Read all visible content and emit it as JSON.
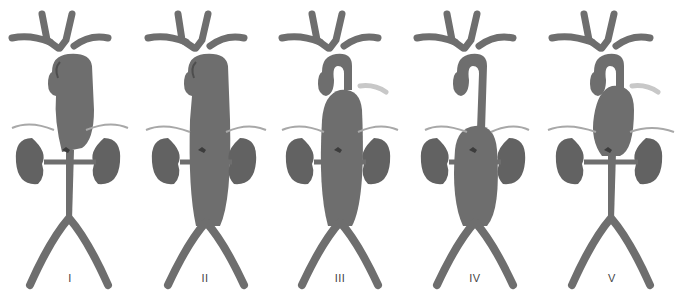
{
  "figure": {
    "colors": {
      "vessel": "#6e6e6e",
      "vessel_shade": "#5a5a5a",
      "vessel_light": "#8a8a8a",
      "kidney": "#666666",
      "nerve_line": "#a0a0a0",
      "background": "#ffffff"
    },
    "panels": [
      {
        "label": "I",
        "extent": "descending thoracic to upper abdominal aorta",
        "arch_cut": false
      },
      {
        "label": "II",
        "extent": "descending thoracic to aortic bifurcation",
        "arch_cut": false
      },
      {
        "label": "III",
        "extent": "mid-descending thoracic to bifurcation",
        "arch_cut": true
      },
      {
        "label": "IV",
        "extent": "abdominal aorta including visceral segment",
        "arch_cut": false
      },
      {
        "label": "V",
        "extent": "mid-descending thoracic to above renal arteries",
        "arch_cut": true
      }
    ]
  }
}
